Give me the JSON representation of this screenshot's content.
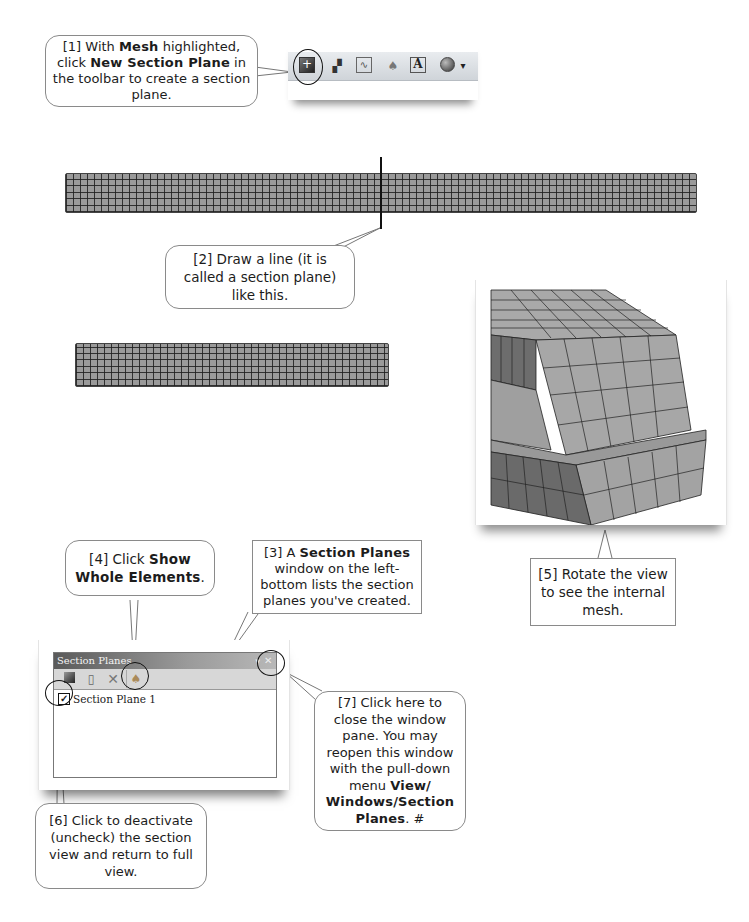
{
  "callouts": {
    "step1": {
      "prefix": "[1] With ",
      "bold1": "Mesh",
      "mid1": " highlighted, click ",
      "bold2": "New Section Plane",
      "suffix": " in the toolbar to create a section plane."
    },
    "step2": {
      "text": "[2] Draw a line (it is called a section plane) like this."
    },
    "step3": {
      "prefix": "[3] A ",
      "bold": "Section Planes",
      "suffix": " window on the left-bottom lists the section planes you've created."
    },
    "step4": {
      "prefix": "[4] Click ",
      "bold": "Show Whole Elements",
      "suffix": "."
    },
    "step5": {
      "text": "[5] Rotate the view to see the internal mesh."
    },
    "step6": {
      "text": "[6] Click to deactivate (uncheck) the section view and return to full view."
    },
    "step7": {
      "prefix": "[7] Click here to close the window pane. You may reopen this window with the pull-down menu ",
      "bold": "View/ Windows/Section Planes",
      "suffix": ". #"
    }
  },
  "main_toolbar": {
    "icons": [
      "new-section-plane-icon",
      "new-section-plane-alt-icon",
      "chart-icon",
      "bell-icon",
      "text-annotation-icon",
      "sphere-display-icon"
    ],
    "dropdown_glyph": "▾"
  },
  "section_planes_window": {
    "title": "Section Planes",
    "tools": [
      "new-plane-icon",
      "duplicate-plane-icon",
      "delete-icon",
      "show-whole-elements-icon"
    ],
    "items": [
      {
        "label": "Section Plane 1",
        "checked": true
      }
    ],
    "close_glyph": "✕",
    "pin_glyph": "▾"
  },
  "colors": {
    "mesh_fill": "#9a9a9a",
    "mesh_line": "#1e1e1e",
    "callout_border": "#8a8a8a"
  }
}
